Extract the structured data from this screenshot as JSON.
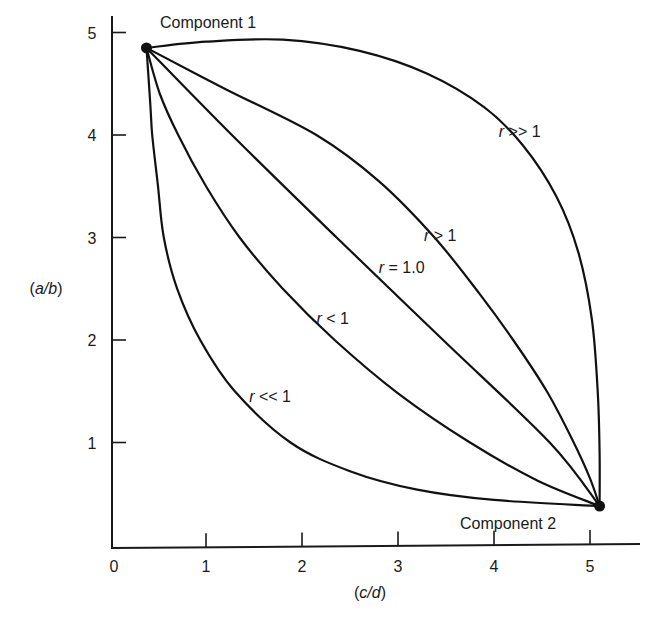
{
  "chart_data": {
    "type": "line",
    "title": "",
    "xlabel": "(c/d)",
    "ylabel": "(a/b)",
    "xlim": [
      0,
      5.5
    ],
    "ylim": [
      0,
      5
    ],
    "grid": false,
    "legend": "none (inline curve labels)",
    "x_ticks": [
      0,
      1,
      2,
      3,
      4,
      5
    ],
    "y_ticks": [
      1,
      2,
      3,
      4,
      5
    ],
    "endpoints": [
      {
        "name": "Component 1",
        "x": 0.38,
        "y": 4.85
      },
      {
        "name": "Component 2",
        "x": 5.1,
        "y": 0.38
      }
    ],
    "series": [
      {
        "name": "r >> 1",
        "label_prefix": "r",
        "label_suffix": " >> 1",
        "label_pos": [
          4.05,
          3.98
        ],
        "points": [
          [
            0.38,
            4.85
          ],
          [
            1.0,
            4.91
          ],
          [
            1.8,
            4.93
          ],
          [
            2.6,
            4.82
          ],
          [
            3.3,
            4.6
          ],
          [
            3.9,
            4.27
          ],
          [
            4.3,
            3.9
          ],
          [
            4.65,
            3.4
          ],
          [
            4.88,
            2.85
          ],
          [
            5.02,
            2.2
          ],
          [
            5.08,
            1.5
          ],
          [
            5.1,
            0.9
          ],
          [
            5.1,
            0.38
          ]
        ]
      },
      {
        "name": "r > 1",
        "label_prefix": "r",
        "label_suffix": " > 1",
        "label_pos": [
          3.27,
          2.97
        ],
        "points": [
          [
            0.38,
            4.85
          ],
          [
            1.2,
            4.45
          ],
          [
            2.15,
            4.0
          ],
          [
            2.8,
            3.55
          ],
          [
            3.38,
            3.0
          ],
          [
            3.85,
            2.45
          ],
          [
            4.2,
            2.0
          ],
          [
            4.55,
            1.5
          ],
          [
            4.83,
            1.0
          ],
          [
            5.0,
            0.65
          ],
          [
            5.1,
            0.38
          ]
        ]
      },
      {
        "name": "r = 1.0",
        "label_prefix": "r",
        "label_suffix": " = 1.0",
        "label_pos": [
          2.8,
          2.65
        ],
        "points": [
          [
            0.38,
            4.85
          ],
          [
            1.27,
            4.0
          ],
          [
            2.36,
            3.0
          ],
          [
            3.47,
            2.0
          ],
          [
            4.58,
            1.0
          ],
          [
            5.1,
            0.38
          ]
        ]
      },
      {
        "name": "r < 1",
        "label_prefix": "r",
        "label_suffix": " < 1",
        "label_pos": [
          2.15,
          2.16
        ],
        "points": [
          [
            0.38,
            4.85
          ],
          [
            0.52,
            4.4
          ],
          [
            0.71,
            4.0
          ],
          [
            1.0,
            3.5
          ],
          [
            1.35,
            3.0
          ],
          [
            1.8,
            2.5
          ],
          [
            2.34,
            2.0
          ],
          [
            3.0,
            1.48
          ],
          [
            3.75,
            1.0
          ],
          [
            4.45,
            0.63
          ],
          [
            5.1,
            0.38
          ]
        ]
      },
      {
        "name": "r << 1",
        "label_prefix": "r",
        "label_suffix": " << 1",
        "label_pos": [
          1.45,
          1.4
        ],
        "points": [
          [
            0.38,
            4.85
          ],
          [
            0.42,
            4.3
          ],
          [
            0.44,
            4.0
          ],
          [
            0.5,
            3.5
          ],
          [
            0.56,
            3.0
          ],
          [
            0.7,
            2.5
          ],
          [
            0.94,
            2.0
          ],
          [
            1.3,
            1.5
          ],
          [
            1.88,
            1.0
          ],
          [
            2.5,
            0.72
          ],
          [
            3.2,
            0.54
          ],
          [
            4.0,
            0.44
          ],
          [
            5.1,
            0.38
          ]
        ]
      }
    ]
  },
  "axes": {
    "x_tick_labels": [
      "0",
      "1",
      "2",
      "3",
      "4",
      "5"
    ],
    "y_tick_labels": [
      "1",
      "2",
      "3",
      "4",
      "5"
    ],
    "x_label_open": "(",
    "x_label_var": "c/d",
    "x_label_close": ")",
    "y_label_open": "(",
    "y_label_var": "a/b",
    "y_label_close": ")"
  },
  "labels": {
    "component_1": "Component 1",
    "component_2": "Component 2"
  },
  "style": {
    "line_color": "#111111",
    "background": "#ffffff"
  }
}
